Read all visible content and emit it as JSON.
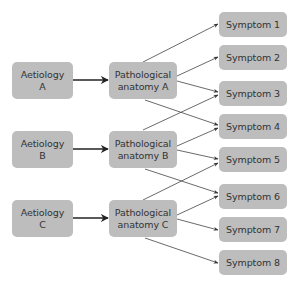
{
  "diagram": {
    "colors": {
      "node_fill": "#bdbdbd",
      "node_text": "#333333",
      "edge": "#333333",
      "background": "#ffffff"
    },
    "aetiologies": [
      {
        "id": "aetA",
        "line1": "Aetiology",
        "line2": "A"
      },
      {
        "id": "aetB",
        "line1": "Aetiology",
        "line2": "B"
      },
      {
        "id": "aetC",
        "line1": "Aetiology",
        "line2": "C"
      }
    ],
    "anatomies": [
      {
        "id": "patA",
        "line1": "Pathological",
        "line2": "anatomy A"
      },
      {
        "id": "patB",
        "line1": "Pathological",
        "line2": "anatomy B"
      },
      {
        "id": "patC",
        "line1": "Pathological",
        "line2": "anatomy C"
      }
    ],
    "symptoms": [
      {
        "id": "s1",
        "label": "Symptom 1"
      },
      {
        "id": "s2",
        "label": "Symptom 2"
      },
      {
        "id": "s3",
        "label": "Symptom 3"
      },
      {
        "id": "s4",
        "label": "Symptom 4"
      },
      {
        "id": "s5",
        "label": "Symptom 5"
      },
      {
        "id": "s6",
        "label": "Symptom 6"
      },
      {
        "id": "s7",
        "label": "Symptom 7"
      },
      {
        "id": "s8",
        "label": "Symptom 8"
      }
    ],
    "edges": [
      {
        "from": "Aetiology A",
        "to": "Pathological anatomy A",
        "style": "thick"
      },
      {
        "from": "Aetiology B",
        "to": "Pathological anatomy B",
        "style": "thick"
      },
      {
        "from": "Aetiology C",
        "to": "Pathological anatomy C",
        "style": "thick"
      },
      {
        "from": "Pathological anatomy A",
        "to": "Symptom 1"
      },
      {
        "from": "Pathological anatomy A",
        "to": "Symptom 2"
      },
      {
        "from": "Pathological anatomy A",
        "to": "Symptom 3"
      },
      {
        "from": "Pathological anatomy A",
        "to": "Symptom 4"
      },
      {
        "from": "Pathological anatomy B",
        "to": "Symptom 3"
      },
      {
        "from": "Pathological anatomy B",
        "to": "Symptom 4"
      },
      {
        "from": "Pathological anatomy B",
        "to": "Symptom 5"
      },
      {
        "from": "Pathological anatomy B",
        "to": "Symptom 6"
      },
      {
        "from": "Pathological anatomy C",
        "to": "Symptom 5"
      },
      {
        "from": "Pathological anatomy C",
        "to": "Symptom 6"
      },
      {
        "from": "Pathological anatomy C",
        "to": "Symptom 7"
      },
      {
        "from": "Pathological anatomy C",
        "to": "Symptom 8"
      }
    ]
  }
}
